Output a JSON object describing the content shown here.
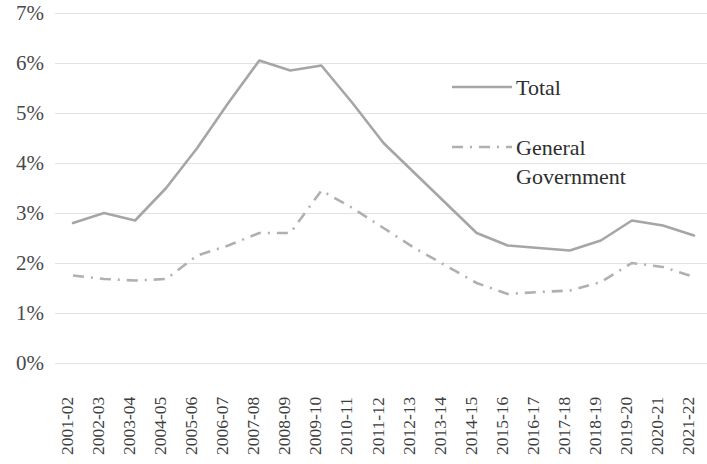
{
  "chart_data": {
    "type": "line",
    "title": "",
    "subtitle": "",
    "xlabel": "",
    "ylabel": "",
    "grid": true,
    "legend_position": "inside-top-right",
    "ylim": [
      0,
      7
    ],
    "ytick_values": [
      0,
      1,
      2,
      3,
      4,
      5,
      6,
      7
    ],
    "ytick_labels": [
      "0%",
      "1%",
      "2%",
      "3%",
      "4%",
      "5%",
      "6%",
      "7%"
    ],
    "categories": [
      "2001-02",
      "2002-03",
      "2003-04",
      "2004-05",
      "2005-06",
      "2006-07",
      "2007-08",
      "2008-09",
      "2009-10",
      "2010-11",
      "2011-12",
      "2012-13",
      "2013-14",
      "2014-15",
      "2015-16",
      "2016-17",
      "2017-18",
      "2018-19",
      "2019-20",
      "2020-21",
      "2021-22"
    ],
    "series": [
      {
        "name": "Total",
        "style": "solid",
        "color": "#a6a6a6",
        "values": [
          2.8,
          3.0,
          2.85,
          3.5,
          4.3,
          5.2,
          6.05,
          5.85,
          5.95,
          5.2,
          4.4,
          3.8,
          3.2,
          2.6,
          2.35,
          2.3,
          2.25,
          2.45,
          2.85,
          2.75,
          2.55
        ]
      },
      {
        "name": "General Government",
        "style": "dash-dot",
        "color": "#b0b0b0",
        "values": [
          1.75,
          1.68,
          1.65,
          1.68,
          2.15,
          2.35,
          2.6,
          2.6,
          3.45,
          3.1,
          2.7,
          2.3,
          1.95,
          1.6,
          1.38,
          1.42,
          1.45,
          1.62,
          2.0,
          1.92,
          1.72
        ]
      }
    ]
  },
  "legend": {
    "items": [
      {
        "label": "Total",
        "style": "solid"
      },
      {
        "label": "General\nGovernment",
        "style": "dash-dot"
      }
    ],
    "item_total_label": "Total",
    "item_gg_label_line1": "General",
    "item_gg_label_line2": "Government"
  },
  "colors": {
    "total_line": "#a6a6a6",
    "general_government_line": "#b0b0b0",
    "gridline": "#e2e2e2",
    "text": "#3a3a3a",
    "background": "#ffffff"
  }
}
